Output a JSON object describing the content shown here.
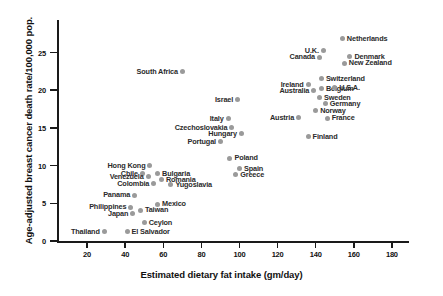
{
  "chart_data": {
    "type": "scatter",
    "title": "",
    "xlabel": "Estimated dietary fat intake (gm/day)",
    "ylabel": "Age-adjusted breast cancer death rate/100,000 pop.",
    "xlim": [
      0,
      190
    ],
    "ylim": [
      0,
      27.5
    ],
    "xticks": [
      20,
      40,
      60,
      80,
      100,
      120,
      140,
      160,
      180
    ],
    "yticks": [
      0,
      5,
      10,
      15,
      20,
      25
    ],
    "grid": false,
    "legend": null,
    "point_color": "#9a9a9a",
    "axis_color": "#1a1a1a",
    "label_color": "#2b2b2b",
    "points": [
      {
        "name": "Netherlands",
        "x": 154,
        "y": 26.8,
        "side": "right"
      },
      {
        "name": "U.K.",
        "x": 144,
        "y": 25.2,
        "side": "right"
      },
      {
        "name": "Canada",
        "x": 142,
        "y": 24.4,
        "side": "right"
      },
      {
        "name": "Denmark",
        "x": 158,
        "y": 24.5,
        "side": "right"
      },
      {
        "name": "New Zealand",
        "x": 155,
        "y": 23.6,
        "side": "right"
      },
      {
        "name": "South Africa",
        "x": 70,
        "y": 22.5,
        "side": "right"
      },
      {
        "name": "Switzerland",
        "x": 143,
        "y": 21.6,
        "side": "right"
      },
      {
        "name": "Ireland",
        "x": 136,
        "y": 20.8,
        "side": "right"
      },
      {
        "name": "Belgium",
        "x": 143,
        "y": 20.2,
        "side": "right"
      },
      {
        "name": "U.S.A.",
        "x": 150,
        "y": 20.4,
        "side": "right"
      },
      {
        "name": "Australia",
        "x": 139,
        "y": 19.9,
        "side": "right"
      },
      {
        "name": "Sweden",
        "x": 142,
        "y": 19.0,
        "side": "right"
      },
      {
        "name": "Israel",
        "x": 99,
        "y": 18.8,
        "side": "right"
      },
      {
        "name": "Germany",
        "x": 145,
        "y": 18.2,
        "side": "right"
      },
      {
        "name": "Norway",
        "x": 140,
        "y": 17.3,
        "side": "right"
      },
      {
        "name": "France",
        "x": 146,
        "y": 16.3,
        "side": "right"
      },
      {
        "name": "Italy",
        "x": 94,
        "y": 16.2,
        "side": "right"
      },
      {
        "name": "Austria",
        "x": 131,
        "y": 16.4,
        "side": "right"
      },
      {
        "name": "Czechoslovakia",
        "x": 96,
        "y": 15.1,
        "side": "right"
      },
      {
        "name": "Hungary",
        "x": 101,
        "y": 14.2,
        "side": "right"
      },
      {
        "name": "Finland",
        "x": 136,
        "y": 13.9,
        "side": "right"
      },
      {
        "name": "Portugal",
        "x": 90,
        "y": 13.2,
        "side": "right"
      },
      {
        "name": "Poland",
        "x": 95,
        "y": 11.0,
        "side": "right"
      },
      {
        "name": "Hong Kong",
        "x": 53,
        "y": 10.0,
        "side": "right"
      },
      {
        "name": "Spain",
        "x": 100,
        "y": 9.6,
        "side": "right"
      },
      {
        "name": "Chile",
        "x": 49,
        "y": 9.0,
        "side": "right"
      },
      {
        "name": "Bulgaria",
        "x": 57,
        "y": 8.9,
        "side": "right"
      },
      {
        "name": "Greece",
        "x": 98,
        "y": 8.8,
        "side": "right"
      },
      {
        "name": "Venezuela",
        "x": 52,
        "y": 8.6,
        "side": "right"
      },
      {
        "name": "Romania",
        "x": 59,
        "y": 8.2,
        "side": "right"
      },
      {
        "name": "Colombia",
        "x": 55,
        "y": 7.6,
        "side": "right"
      },
      {
        "name": "Yugoslavia",
        "x": 64,
        "y": 7.5,
        "side": "right"
      },
      {
        "name": "Panama",
        "x": 45,
        "y": 6.1,
        "side": "right"
      },
      {
        "name": "Mexico",
        "x": 57,
        "y": 4.9,
        "side": "right"
      },
      {
        "name": "Philippines",
        "x": 43,
        "y": 4.5,
        "side": "right"
      },
      {
        "name": "Taiwan",
        "x": 48,
        "y": 4.1,
        "side": "right"
      },
      {
        "name": "Japan",
        "x": 44,
        "y": 3.7,
        "side": "right"
      },
      {
        "name": "Ceylon",
        "x": 50,
        "y": 2.5,
        "side": "right"
      },
      {
        "name": "El Salvador",
        "x": 41,
        "y": 1.2,
        "side": "right"
      },
      {
        "name": "Thailand",
        "x": 29,
        "y": 1.2,
        "side": "right"
      }
    ]
  }
}
